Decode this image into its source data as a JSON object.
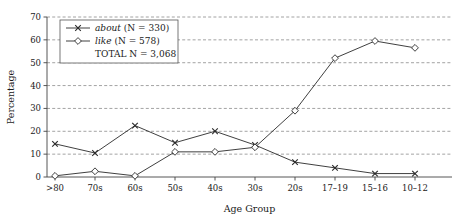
{
  "chart_data": {
    "type": "line",
    "title": "",
    "xlabel": "Age Group",
    "ylabel": "Percentage",
    "categories": [
      ">80",
      "70s",
      "60s",
      "50s",
      "40s",
      "30s",
      "20s",
      "17–19",
      "15–16",
      "10–12"
    ],
    "ylim": [
      0,
      70
    ],
    "yticks": [
      0,
      10,
      20,
      30,
      40,
      50,
      60,
      70
    ],
    "ytick_labels": [
      "0",
      "10",
      "20",
      "30",
      "40",
      "50",
      "60",
      "70"
    ],
    "grid": true,
    "legend_position": "top-left",
    "series": [
      {
        "name": "about",
        "legend_label": "about (N = 330)",
        "marker": "x",
        "n": 330,
        "values": [
          14.5,
          10.5,
          22.5,
          15.0,
          20.0,
          14.0,
          6.5,
          4.0,
          1.5,
          1.5
        ]
      },
      {
        "name": "like",
        "legend_label": "like (N = 578)",
        "marker": "diamond",
        "n": 578,
        "values": [
          0.5,
          2.5,
          0.5,
          11.0,
          11.0,
          13.0,
          29.0,
          52.0,
          59.5,
          56.5
        ]
      }
    ],
    "annotations": [
      "TOTAL N = 3,068"
    ]
  },
  "legend": {
    "entry1_italic": "about",
    "entry1_rest": " (N = 330)",
    "entry2_italic": "like",
    "entry2_rest": " (N = 578)",
    "total_label": "TOTAL N = 3,068"
  },
  "axes": {
    "x_title": "Age Group",
    "y_title": "Percentage"
  }
}
